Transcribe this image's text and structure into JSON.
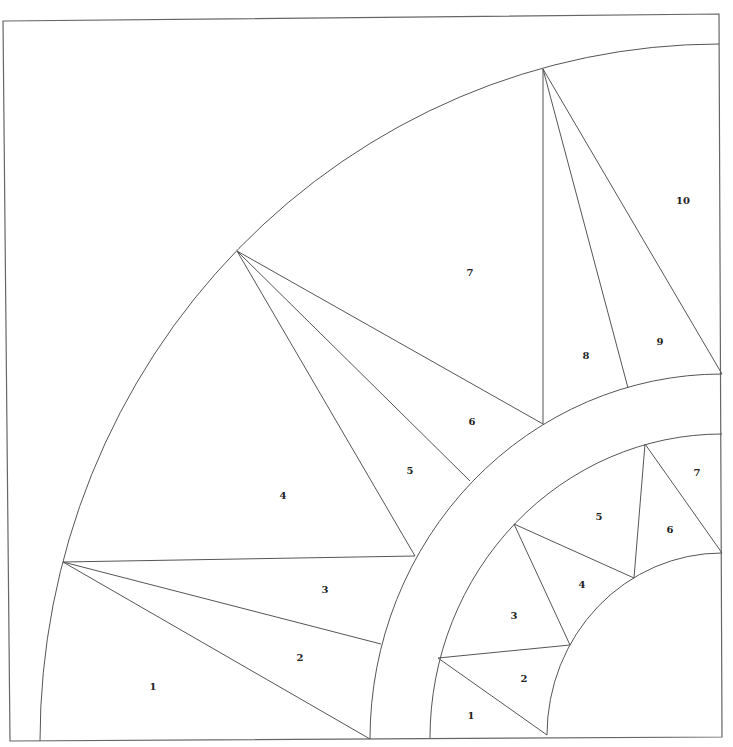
{
  "pattern": {
    "type": "paper-piecing quadrant (mariner's compass)",
    "colors": {
      "line": "#555555",
      "background": "#ffffff",
      "label": "#222222"
    }
  },
  "outer_ring": {
    "labels": [
      {
        "text": "1",
        "x": 153,
        "y": 686
      },
      {
        "text": "2",
        "x": 300,
        "y": 657
      },
      {
        "text": "3",
        "x": 325,
        "y": 589
      },
      {
        "text": "4",
        "x": 283,
        "y": 495
      },
      {
        "text": "5",
        "x": 410,
        "y": 470
      },
      {
        "text": "6",
        "x": 472,
        "y": 421
      },
      {
        "text": "7",
        "x": 470,
        "y": 272
      },
      {
        "text": "8",
        "x": 586,
        "y": 355
      },
      {
        "text": "9",
        "x": 660,
        "y": 341
      },
      {
        "text": "10",
        "x": 683,
        "y": 200
      }
    ]
  },
  "inner_ring": {
    "labels": [
      {
        "text": "1",
        "x": 471,
        "y": 715
      },
      {
        "text": "2",
        "x": 524,
        "y": 678
      },
      {
        "text": "3",
        "x": 514,
        "y": 615
      },
      {
        "text": "4",
        "x": 582,
        "y": 584
      },
      {
        "text": "5",
        "x": 599,
        "y": 516
      },
      {
        "text": "6",
        "x": 670,
        "y": 529
      },
      {
        "text": "7",
        "x": 697,
        "y": 472
      }
    ]
  }
}
